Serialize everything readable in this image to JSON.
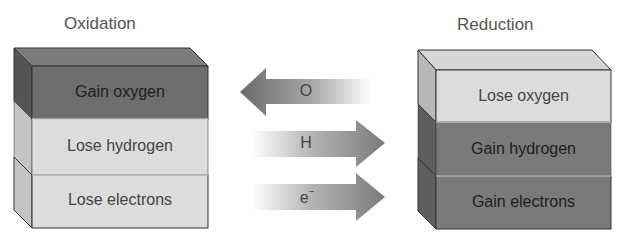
{
  "diagram": {
    "oxidation": {
      "title": "Oxidation",
      "layers": [
        {
          "label": "Gain oxygen",
          "shade": "#6e6e6e"
        },
        {
          "label": "Lose hydrogen",
          "shade": "#dcdcdc"
        },
        {
          "label": "Lose electrons",
          "shade": "#dcdcdc"
        }
      ]
    },
    "reduction": {
      "title": "Reduction",
      "layers": [
        {
          "label": "Lose oxygen",
          "shade": "#dcdcdc"
        },
        {
          "label": "Gain hydrogen",
          "shade": "#7a7a7a"
        },
        {
          "label": "Gain electrons",
          "shade": "#7a7a7a"
        }
      ]
    },
    "arrows": [
      {
        "label": "O",
        "direction": "left"
      },
      {
        "label": "H",
        "direction": "right"
      },
      {
        "label": "e",
        "superscript": "−",
        "direction": "right"
      }
    ]
  }
}
